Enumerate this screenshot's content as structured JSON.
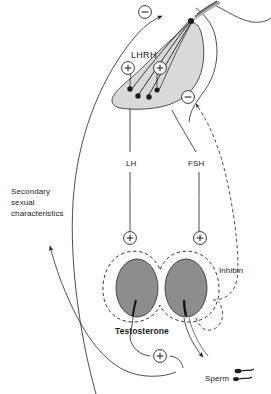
{
  "diagram": {
    "colors": {
      "stroke": "#333333",
      "text": "#1a1a1a",
      "gland_fill": "#d8d8d8",
      "testis_fill": "#8a8a8a",
      "background": "#ffffff"
    },
    "labels": {
      "lhrh": "LHRH",
      "lh": "LH",
      "fsh": "FSH",
      "secondary_sexual_characteristics": "Secondary\nsexual\ncharacteristics",
      "testosterone": "Testosterone",
      "inhibin": "Inhibin",
      "sperm": "Sperm"
    },
    "signs": {
      "negative": "−",
      "positive": "+"
    },
    "feedback_markers": [
      {
        "id": "neg-top",
        "sign": "−",
        "x": 145,
        "y": 12,
        "meaning": "negative-feedback-to-hypothalamus"
      },
      {
        "id": "neg-pituitary",
        "sign": "−",
        "x": 188,
        "y": 97,
        "meaning": "negative-feedback-to-pituitary"
      },
      {
        "id": "pos-lhrh-left",
        "sign": "+",
        "x": 128,
        "y": 68,
        "meaning": "stimulation-left"
      },
      {
        "id": "pos-lhrh-right",
        "sign": "+",
        "x": 160,
        "y": 68,
        "meaning": "stimulation-right"
      },
      {
        "id": "pos-testis-left",
        "sign": "+",
        "x": 130,
        "y": 238,
        "meaning": "lh-stimulates-testis"
      },
      {
        "id": "pos-testis-right",
        "sign": "+",
        "x": 200,
        "y": 238,
        "meaning": "fsh-stimulates-testis"
      },
      {
        "id": "pos-testosterone",
        "sign": "+",
        "x": 160,
        "y": 355,
        "meaning": "testosterone-promotes-spermatogenesis"
      }
    ],
    "pathways": [
      {
        "name": "lh",
        "from": "anterior-pituitary",
        "to": "testis",
        "style": "solid"
      },
      {
        "name": "fsh",
        "from": "anterior-pituitary",
        "to": "testis",
        "style": "solid"
      },
      {
        "name": "testosterone",
        "from": "testis",
        "to": "secondary-sexual-characteristics",
        "style": "solid"
      },
      {
        "name": "inhibin",
        "from": "testis",
        "to": "anterior-pituitary",
        "style": "dashed"
      },
      {
        "name": "sperm",
        "from": "testis",
        "to": "sperm",
        "style": "solid"
      }
    ]
  }
}
